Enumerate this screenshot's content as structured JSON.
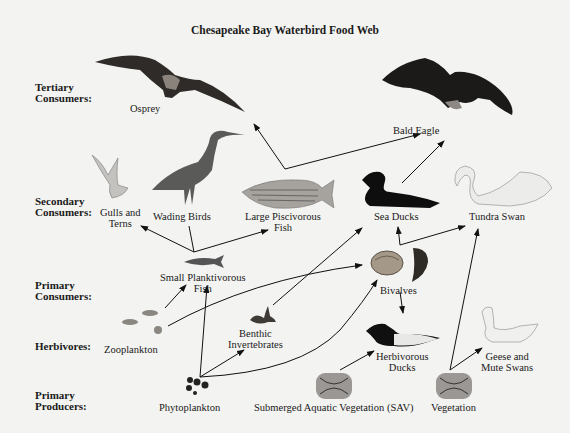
{
  "title": "Chesapeake Bay Waterbird Food Web",
  "levels": {
    "tertiary": [
      "Tertiary",
      "Consumers:"
    ],
    "secondary": [
      "Secondary",
      "Consumers:"
    ],
    "primary": [
      "Primary",
      "Consumers:"
    ],
    "herbivores": "Herbivores:",
    "producers": [
      "Primary",
      "Producers:"
    ]
  },
  "organisms": {
    "osprey": "Osprey",
    "bald_eagle": "Bald Eagle",
    "gulls": [
      "Gulls and",
      "Terns"
    ],
    "wading_birds": "Wading Birds",
    "large_fish": [
      "Large Piscivorous",
      "Fish"
    ],
    "sea_ducks": "Sea Ducks",
    "tundra_swan": "Tundra Swan",
    "small_fish": [
      "Small Planktivorous",
      "Fish"
    ],
    "bivalves": "Bivalves",
    "zooplankton": "Zooplankton",
    "benthic": [
      "Benthic",
      "Invertebrates"
    ],
    "herb_ducks": [
      "Herbivorous",
      "Ducks"
    ],
    "geese": [
      "Geese and",
      "Mute Swans"
    ],
    "phytoplankton": "Phytoplankton",
    "sav": "Submerged Aquatic Vegetation (SAV)",
    "vegetation": "Vegetation"
  },
  "links": [
    {
      "from": "Large Piscivorous Fish",
      "to": "Osprey"
    },
    {
      "from": "Large Piscivorous Fish",
      "to": "Bald Eagle"
    },
    {
      "from": "Sea Ducks",
      "to": "Bald Eagle"
    },
    {
      "from": "Small Planktivorous Fish",
      "to": "Gulls and Terns"
    },
    {
      "from": "Small Planktivorous Fish",
      "to": "Wading Birds"
    },
    {
      "from": "Small Planktivorous Fish",
      "to": "Large Piscivorous Fish"
    },
    {
      "from": "Bivalves",
      "to": "Sea Ducks"
    },
    {
      "from": "Bivalves",
      "to": "Tundra Swan"
    },
    {
      "from": "Benthic Invertebrates",
      "to": "Sea Ducks"
    },
    {
      "from": "Zooplankton",
      "to": "Small Planktivorous Fish"
    },
    {
      "from": "Zooplankton",
      "to": "Bivalves"
    },
    {
      "from": "Phytoplankton",
      "to": "Small Planktivorous Fish"
    },
    {
      "from": "Phytoplankton",
      "to": "Benthic Invertebrates"
    },
    {
      "from": "Phytoplankton",
      "to": "Bivalves"
    },
    {
      "from": "Bivalves",
      "to": "Herbivorous Ducks"
    },
    {
      "from": "SAV",
      "to": "Herbivorous Ducks"
    },
    {
      "from": "Vegetation",
      "to": "Geese and Mute Swans"
    },
    {
      "from": "Vegetation",
      "to": "Tundra Swan"
    }
  ]
}
